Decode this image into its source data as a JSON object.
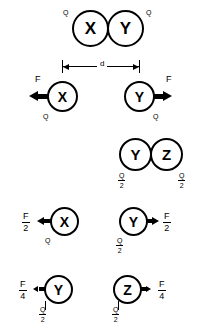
{
  "figure": {
    "ink_color": "#000000",
    "background_color": "#ffffff"
  },
  "labels": {
    "sphere_x": "X",
    "sphere_y": "Y",
    "sphere_z": "Z",
    "charge_q": "Q",
    "charge_q_num": "Q",
    "charge_q_den": "2",
    "force_f": "F",
    "force_f_num": "F",
    "force_half_den": "2",
    "force_quarter_den": "4",
    "distance_d": "d"
  },
  "rows": {
    "row1_contact": {
      "name": "X and Y in contact",
      "left_sphere": "X",
      "right_sphere": "Y",
      "left_charge": "Q",
      "right_charge": "Q"
    },
    "row2_separated": {
      "name": "X and Y separated by d with force F",
      "left_sphere": "X",
      "right_sphere": "Y",
      "left_charge": "Q",
      "right_charge": "Q",
      "left_force": "F",
      "right_force": "F",
      "separation": "d"
    },
    "row3_contact": {
      "name": "Y and Z in contact sharing charge",
      "left_sphere": "Y",
      "right_sphere": "Z",
      "left_charge_num": "Q",
      "left_charge_den": "2",
      "right_charge_num": "Q",
      "right_charge_den": "2"
    },
    "row4_forces": {
      "name": "X and Y with half force",
      "left_sphere": "X",
      "left_charge": "Q",
      "left_force_num": "F",
      "left_force_den": "2",
      "right_sphere": "Y",
      "right_charge_num": "Q",
      "right_charge_den": "2",
      "right_force_num": "F",
      "right_force_den": "2"
    },
    "row5_forces": {
      "name": "Y and Z with quarter force",
      "left_sphere": "Y",
      "left_charge_num": "Q",
      "left_charge_den": "2",
      "left_force_num": "F",
      "left_force_den": "4",
      "right_sphere": "Z",
      "right_charge_num": "Q",
      "right_charge_den": "2",
      "right_force_num": "F",
      "right_force_den": "4"
    }
  }
}
